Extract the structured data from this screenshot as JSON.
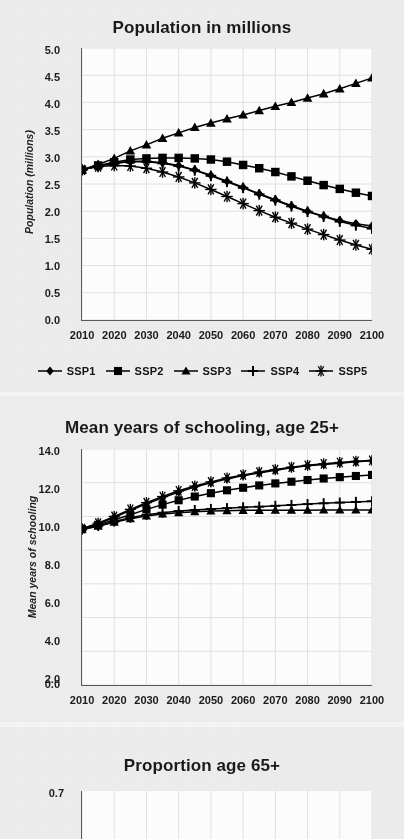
{
  "figure": {
    "background_color": "#eeeeee",
    "ink_color": "#111111",
    "gridline_color": "#e2e2e2",
    "plot_background": "#ffffff"
  },
  "legend": {
    "items": [
      {
        "label": "SSP1",
        "marker": "diamond"
      },
      {
        "label": "SSP2",
        "marker": "square"
      },
      {
        "label": "SSP3",
        "marker": "triangle"
      },
      {
        "label": "SSP4",
        "marker": "plus"
      },
      {
        "label": "SSP5",
        "marker": "asterisk"
      }
    ]
  },
  "panels": [
    {
      "id": "population",
      "title": "Population in millions",
      "ylabel": "Population (millions)"
    },
    {
      "id": "schooling",
      "title": "Mean years of schooling, age 25+",
      "ylabel": "Mean years of schooling"
    },
    {
      "id": "prop65",
      "title": "Proportion age 65+",
      "ylabel": ""
    }
  ],
  "chart_data": [
    {
      "type": "line",
      "title": "Population in millions",
      "xlabel": "",
      "ylabel": "Population (millions)",
      "x": [
        2010,
        2015,
        2020,
        2025,
        2030,
        2035,
        2040,
        2045,
        2050,
        2055,
        2060,
        2065,
        2070,
        2075,
        2080,
        2085,
        2090,
        2095,
        2100
      ],
      "xticklabels": [
        "2010",
        "2020",
        "2030",
        "2040",
        "2050",
        "2060",
        "2070",
        "2080",
        "2090",
        "2100"
      ],
      "yticklabels": [
        "0.0",
        "0.5",
        "1.0",
        "1.5",
        "2.0",
        "2.5",
        "3.0",
        "3.5",
        "4.0",
        "4.5",
        "5.0"
      ],
      "xlim": [
        2010,
        2100
      ],
      "ylim": [
        0.0,
        5.0
      ],
      "grid": true,
      "legend_position": "below",
      "series": [
        {
          "name": "SSP1",
          "marker": "diamond",
          "values": [
            2.76,
            2.83,
            2.88,
            2.92,
            2.92,
            2.89,
            2.84,
            2.76,
            2.66,
            2.55,
            2.44,
            2.32,
            2.21,
            2.1,
            2.0,
            1.91,
            1.83,
            1.77,
            1.73
          ]
        },
        {
          "name": "SSP2",
          "marker": "square",
          "values": [
            2.76,
            2.84,
            2.9,
            2.95,
            2.97,
            2.98,
            2.98,
            2.97,
            2.95,
            2.91,
            2.85,
            2.79,
            2.72,
            2.64,
            2.56,
            2.48,
            2.41,
            2.34,
            2.28
          ]
        },
        {
          "name": "SSP3",
          "marker": "triangle",
          "values": [
            2.76,
            2.86,
            2.97,
            3.11,
            3.22,
            3.34,
            3.44,
            3.54,
            3.62,
            3.7,
            3.77,
            3.85,
            3.93,
            4.0,
            4.08,
            4.16,
            4.25,
            4.35,
            4.45
          ]
        },
        {
          "name": "SSP4",
          "marker": "plus",
          "values": [
            2.76,
            2.83,
            2.88,
            2.91,
            2.91,
            2.88,
            2.83,
            2.75,
            2.65,
            2.54,
            2.43,
            2.31,
            2.2,
            2.09,
            1.99,
            1.9,
            1.81,
            1.74,
            1.68
          ]
        },
        {
          "name": "SSP5",
          "marker": "asterisk",
          "values": [
            2.76,
            2.82,
            2.84,
            2.83,
            2.79,
            2.72,
            2.63,
            2.52,
            2.4,
            2.27,
            2.14,
            2.01,
            1.89,
            1.78,
            1.67,
            1.57,
            1.47,
            1.38,
            1.3
          ]
        }
      ]
    },
    {
      "type": "line",
      "title": "Mean years of schooling, age 25+",
      "xlabel": "",
      "ylabel": "Mean years of schooling",
      "x": [
        2010,
        2015,
        2020,
        2025,
        2030,
        2035,
        2040,
        2045,
        2050,
        2055,
        2060,
        2065,
        2070,
        2075,
        2080,
        2085,
        2090,
        2095,
        2100
      ],
      "xticklabels": [
        "2010",
        "2020",
        "2030",
        "2040",
        "2050",
        "2060",
        "2070",
        "2080",
        "2090",
        "2100"
      ],
      "yticklabels": [
        "0.0",
        "2.0",
        "4.0",
        "6.0",
        "8.0",
        "10.0",
        "12.0",
        "14.0"
      ],
      "xlim": [
        2010,
        2100
      ],
      "ylim": [
        0.0,
        14.0
      ],
      "grid": true,
      "legend_position": "none",
      "series": [
        {
          "name": "SSP1",
          "marker": "diamond",
          "values": [
            9.25,
            9.55,
            9.95,
            10.35,
            10.75,
            11.1,
            11.45,
            11.75,
            12.0,
            12.22,
            12.42,
            12.58,
            12.74,
            12.88,
            13.0,
            13.08,
            13.16,
            13.24,
            13.3
          ]
        },
        {
          "name": "SSP2",
          "marker": "square",
          "values": [
            9.25,
            9.5,
            9.8,
            10.1,
            10.42,
            10.7,
            10.96,
            11.18,
            11.38,
            11.55,
            11.7,
            11.84,
            11.96,
            12.06,
            12.16,
            12.25,
            12.33,
            12.4,
            12.46
          ]
        },
        {
          "name": "SSP3",
          "marker": "triangle",
          "values": [
            9.22,
            9.42,
            9.65,
            9.86,
            10.02,
            10.14,
            10.22,
            10.28,
            10.32,
            10.34,
            10.36,
            10.36,
            10.37,
            10.37,
            10.37,
            10.38,
            10.38,
            10.38,
            10.38
          ]
        },
        {
          "name": "SSP4",
          "marker": "plus",
          "values": [
            9.22,
            9.44,
            9.7,
            9.93,
            10.1,
            10.22,
            10.32,
            10.38,
            10.44,
            10.49,
            10.54,
            10.58,
            10.63,
            10.68,
            10.73,
            10.78,
            10.82,
            10.86,
            10.9
          ]
        },
        {
          "name": "SSP5",
          "marker": "asterisk",
          "values": [
            9.28,
            9.6,
            10.0,
            10.42,
            10.82,
            11.18,
            11.52,
            11.8,
            12.05,
            12.28,
            12.46,
            12.63,
            12.78,
            12.92,
            13.03,
            13.12,
            13.2,
            13.27,
            13.32
          ]
        }
      ]
    },
    {
      "type": "line",
      "title": "Proportion age 65+",
      "xlabel": "",
      "ylabel": "",
      "x": [],
      "xticklabels": [],
      "yticklabels": [
        "0.7"
      ],
      "ylim": [
        0.0,
        0.7
      ],
      "grid": true,
      "legend_position": "none",
      "series": []
    }
  ]
}
